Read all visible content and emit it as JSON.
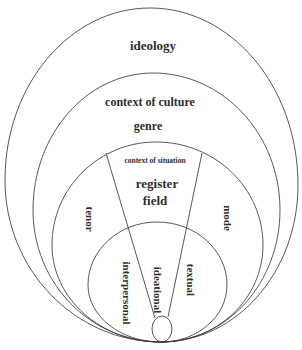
{
  "diagram": {
    "type": "nested-ellipses",
    "levels": [
      {
        "id": "ideology",
        "label": "ideology"
      },
      {
        "id": "context-of-culture",
        "label": "context of culture",
        "sublabel": "genre"
      },
      {
        "id": "context-of-situation",
        "label": "context of situation",
        "sublabel_1": "register",
        "sublabel_2": "field",
        "left_label": "tenor",
        "right_label": "mode"
      },
      {
        "id": "metafunctions",
        "labels": [
          "interpersonal",
          "ideational",
          "textual"
        ]
      }
    ]
  },
  "labels": {
    "ideology": "ideology",
    "context_of_culture": "context of culture",
    "genre": "genre",
    "context_of_situation": "context of situation",
    "register": "register",
    "field": "field",
    "tenor": "tenor",
    "mode": "mode",
    "interpersonal": "interpersonal",
    "ideational": "ideational",
    "textual": "textual"
  }
}
